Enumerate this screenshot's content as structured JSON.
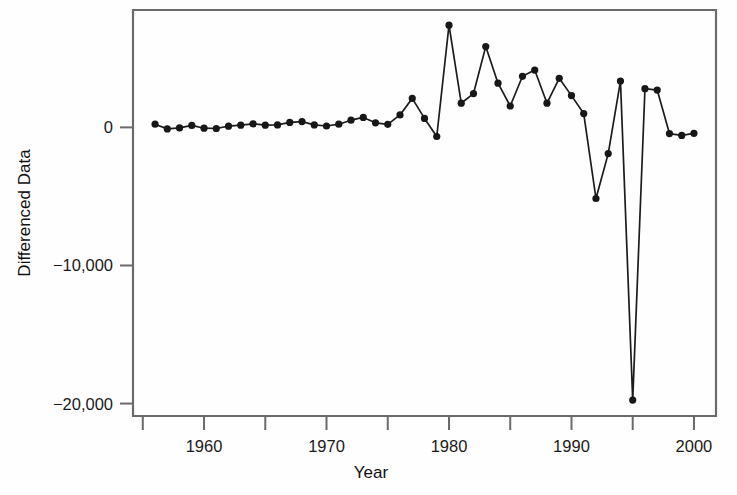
{
  "chart_data": {
    "type": "line",
    "title": "",
    "xlabel": "Year",
    "ylabel": "Differenced Data",
    "xlim": [
      1954.2,
      2001.8
    ],
    "ylim": [
      -20900,
      8500
    ],
    "grid": false,
    "legend": null,
    "marker": "filled-circle",
    "x_ticks_major": [
      1960,
      1970,
      1980,
      1990,
      2000
    ],
    "x_ticks_minor": [
      1955,
      1965,
      1975,
      1985,
      1995
    ],
    "x_tick_labels": [
      "1960",
      "1970",
      "1980",
      "1990",
      "2000"
    ],
    "y_ticks": [
      0,
      -10000,
      -20000
    ],
    "y_tick_labels": [
      "0",
      "−10,000",
      "−20,000"
    ],
    "series": [
      {
        "name": "Differenced Data",
        "color": "#171717",
        "x": [
          1956,
          1957,
          1958,
          1959,
          1960,
          1961,
          1962,
          1963,
          1964,
          1965,
          1966,
          1967,
          1968,
          1969,
          1970,
          1971,
          1972,
          1973,
          1974,
          1975,
          1976,
          1977,
          1978,
          1979,
          1980,
          1981,
          1982,
          1983,
          1984,
          1985,
          1986,
          1987,
          1988,
          1989,
          1990,
          1991,
          1992,
          1993,
          1994,
          1995,
          1996,
          1997,
          1998,
          1999,
          2000
        ],
        "values": [
          230,
          -110,
          -40,
          140,
          -60,
          -80,
          90,
          160,
          260,
          160,
          180,
          360,
          420,
          180,
          100,
          230,
          520,
          720,
          330,
          220,
          900,
          2100,
          650,
          -660,
          7400,
          1750,
          2450,
          5850,
          3200,
          1550,
          3700,
          4150,
          1750,
          3550,
          2300,
          1000,
          -5150,
          -1900,
          3350,
          -19750,
          2800,
          2700,
          -450,
          -580,
          -430
        ]
      }
    ]
  },
  "axes": {
    "y_title": "Differenced Data",
    "x_title": "Year"
  }
}
